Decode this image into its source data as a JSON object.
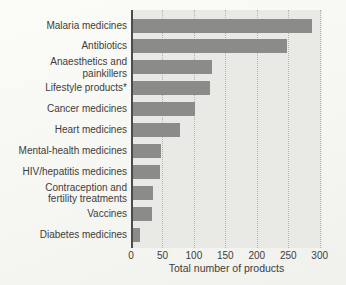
{
  "chart_data": {
    "type": "bar",
    "orientation": "horizontal",
    "title": "",
    "xlabel": "Total number of products",
    "ylabel": "",
    "xlim": [
      0,
      300
    ],
    "xticks": [
      0,
      50,
      100,
      150,
      200,
      250,
      300
    ],
    "grid": "vertical dotted gridlines on",
    "legend": "none",
    "categories": [
      "Malaria medicines",
      "Antibiotics",
      "Anaesthetics and\npainkillers",
      "Lifestyle products*",
      "Cancer medicines",
      "Heart medicines",
      "Mental-health medicines",
      "HIV/hepatitis medicines",
      "Contraception and\nfertility treatments",
      "Vaccines",
      "Diabetes medicines"
    ],
    "values": [
      285,
      245,
      125,
      122,
      98,
      75,
      45,
      43,
      32,
      31,
      11
    ],
    "colors": {
      "bar": "#8b8b89",
      "plot_background": "#e9e9e6",
      "gridline": "#b4b4b0",
      "axis_line": "#4c4c4a",
      "text": "#3e3d3b",
      "page_background": "#f6f6f2"
    }
  }
}
